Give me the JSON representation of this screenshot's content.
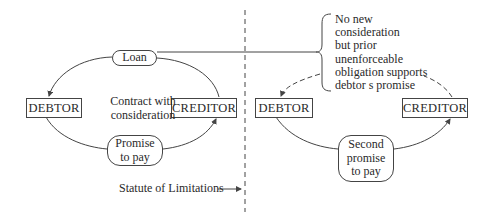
{
  "left": {
    "loan_label": "Loan",
    "debtor_label": "DEBTOR",
    "creditor_label": "CREDITOR",
    "contract_line1": "Contract with",
    "contract_line2": "consideration",
    "promise_line1": "Promise",
    "promise_line2": "to pay"
  },
  "divider": {
    "statute_label": "Statute of Limitations"
  },
  "right": {
    "debtor_label": "DEBTOR",
    "creditor_label": "CREDITOR",
    "second_promise_line1": "Second",
    "second_promise_line2": "promise",
    "second_promise_line3": "to pay",
    "note_lines": [
      "No new",
      "consideration",
      "but prior",
      "unenforceable",
      "obligation supports",
      "debtor s promise"
    ]
  },
  "colors": {
    "line": "#444444",
    "text": "#2a2a2a",
    "background": "#ffffff"
  }
}
